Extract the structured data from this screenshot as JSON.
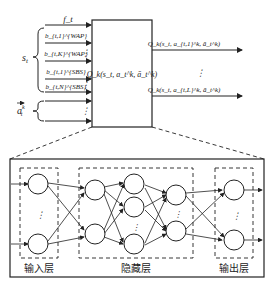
{
  "top": {
    "state_label": "s_t",
    "action_label": "a_t^k (vector)",
    "inputs": [
      "f_t",
      "b_{t,1}^{WAP}",
      "b_{t,K}^{WAP}",
      "b_{t,1}^{SBS}",
      "b_{t,N}^{SBS}"
    ],
    "box_label": "Q_k(s_t, a_t^k, ā_t^k)",
    "outputs": [
      "Q_k(s_t, a_{t,1}^k, ā_t^k)",
      "Q_k(s_t, a_{t,L}^k, ā_t^k)"
    ],
    "ellipsis": "⋮"
  },
  "net": {
    "layers": [
      {
        "name": "input",
        "label": "输入层"
      },
      {
        "name": "hidden",
        "label": "隐藏层"
      },
      {
        "name": "output",
        "label": "输出层"
      }
    ]
  }
}
